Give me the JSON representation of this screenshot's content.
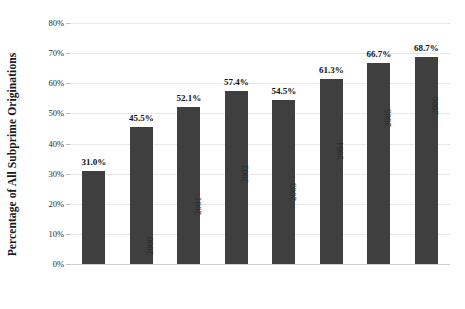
{
  "chart_data": {
    "type": "bar",
    "title": "",
    "subtitle": "",
    "xlabel": "",
    "ylabel": "Percentage of All Subprime Originations",
    "categories": [
      "1999",
      "2000",
      "2001",
      "2002",
      "2003",
      "2004",
      "2005",
      "2006"
    ],
    "values": [
      31.0,
      45.5,
      52.1,
      57.4,
      54.5,
      61.3,
      66.7,
      68.7
    ],
    "data_labels": [
      "31.0%",
      "45.5%",
      "52.1%",
      "57.4%",
      "54.5%",
      "61.3%",
      "66.7%",
      "68.7%"
    ],
    "ylim": [
      0,
      80
    ],
    "ytick_values": [
      0,
      10,
      20,
      30,
      40,
      50,
      60,
      70,
      80
    ],
    "ytick_labels": [
      "0%",
      "10%",
      "20%",
      "30%",
      "40%",
      "50%",
      "60%",
      "70%",
      "80%"
    ],
    "grid": "horizontal",
    "legend": "none",
    "bar_color": "#3f3f3f",
    "gridline_color": "#e8e8e8",
    "background_color": "#ffffff"
  }
}
